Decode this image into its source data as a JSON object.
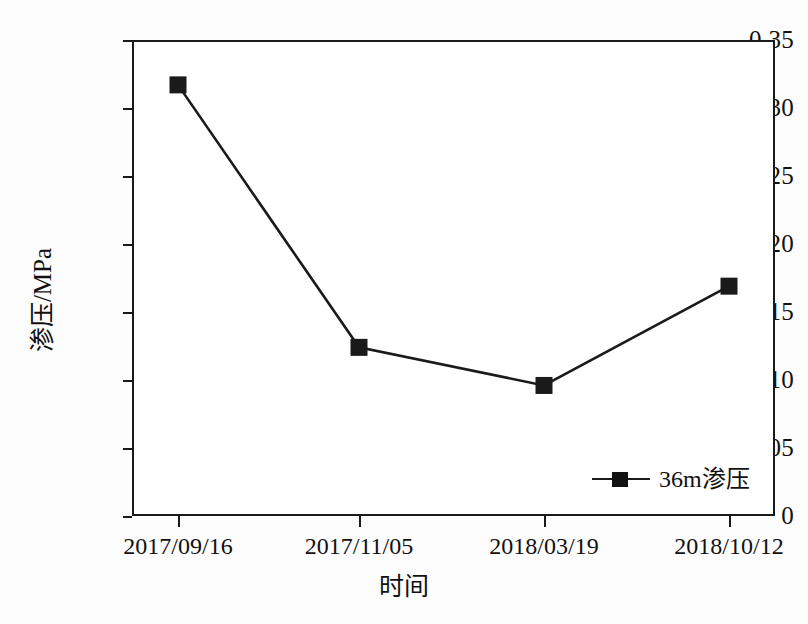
{
  "chart_data": {
    "type": "line",
    "title": "",
    "xlabel": "时间",
    "ylabel": "渗压/MPa",
    "categories": [
      "2017/09/16",
      "2017/11/05",
      "2018/03/19",
      "2018/10/12"
    ],
    "series": [
      {
        "name": "36m渗压",
        "values": [
          0.317,
          0.124,
          0.096,
          0.169
        ],
        "marker": "filled-square",
        "color": "#1a1a1a"
      }
    ],
    "ylim": [
      0,
      0.35
    ],
    "y_ticks": [
      0,
      0.05,
      0.1,
      0.15,
      0.2,
      0.25,
      0.3,
      0.35
    ],
    "y_tick_labels": [
      "0",
      "0.05",
      "0.10",
      "0.15",
      "0.20",
      "0.25",
      "0.30",
      "0.35"
    ],
    "grid": false,
    "legend_position": "bottom-right-inside",
    "frame": "full-box",
    "tick_direction": "outward"
  },
  "axes": {
    "y_title": "渗压/MPa",
    "x_title": "时间",
    "y_tick_labels": [
      "0.35",
      "0.30",
      "0.25",
      "0.20",
      "0.15",
      "0.10",
      "0.05",
      "0"
    ],
    "x_tick_labels": [
      "2017/09/16",
      "2017/11/05",
      "2018/03/19",
      "2018/10/12"
    ]
  },
  "legend": {
    "entries": [
      {
        "label": "36m渗压",
        "marker": "filled-square",
        "color": "#1a1a1a"
      }
    ]
  },
  "style": {
    "line_color": "#1a1a1a",
    "marker_color": "#121212",
    "frame_color": "#1a1a1a",
    "background": "#ffffff"
  }
}
